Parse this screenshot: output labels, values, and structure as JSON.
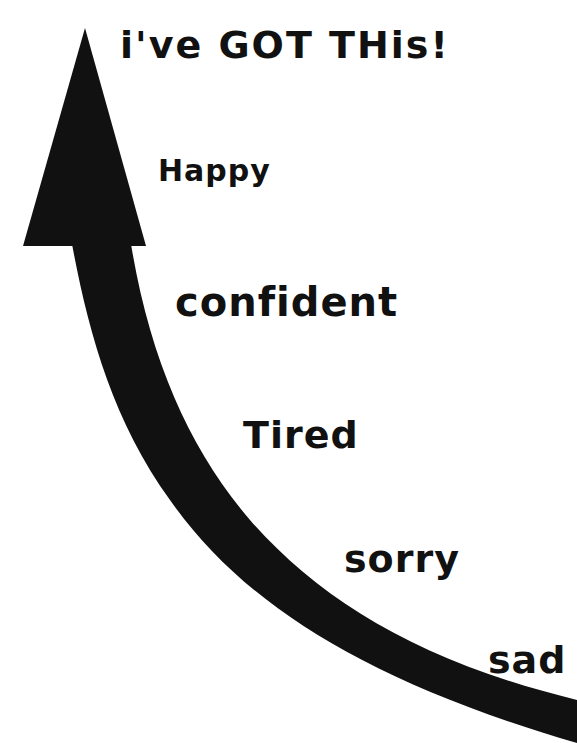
{
  "diagram": {
    "type": "curved-arrow-scale",
    "direction": "bottom-right to top-left (upward)",
    "arrow_color": "#111111",
    "background": "#ffffff",
    "labels": [
      {
        "id": "top",
        "text": "i've GOT THis!"
      },
      {
        "id": "happy",
        "text": "Happy"
      },
      {
        "id": "confident",
        "text": "confident"
      },
      {
        "id": "tired",
        "text": "Tired"
      },
      {
        "id": "sorry",
        "text": "sorry"
      },
      {
        "id": "sad",
        "text": "sad"
      }
    ]
  }
}
